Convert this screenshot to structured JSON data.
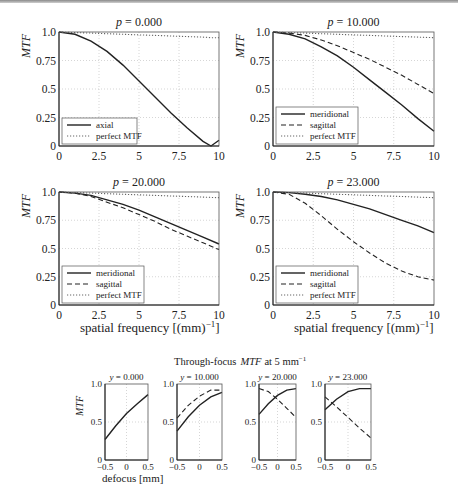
{
  "figure": {
    "top_row_titles": [
      "p = 0.000",
      "p = 10.000"
    ],
    "mid_row_titles": [
      "p = 20.000",
      "p = 23.000"
    ],
    "xlabel": "spatial frequency [(mm)",
    "xlabel_sup": "−1",
    "xlabel_close": "]",
    "ylabel": "MTF",
    "through_focus_title": "Through-focus",
    "through_focus_title_mtf": "MTF",
    "through_focus_title_rest": "at 5 mm",
    "through_focus_title_sup": "−1",
    "defocus_label": "defocus [mm]"
  },
  "chart_data": [
    {
      "type": "line",
      "title": "p = 0.000",
      "xlabel": "",
      "ylabel": "MTF",
      "xlim": [
        0,
        10
      ],
      "ylim": [
        0,
        1
      ],
      "xticks": [
        "0",
        "2.5",
        "5",
        "7.5",
        "10"
      ],
      "yticks": [
        "0",
        "0.25",
        "0.5",
        "0.75",
        "1.0"
      ],
      "grid": true,
      "legend": [
        "axial",
        "perfect MTF"
      ],
      "legend_position": "lower left",
      "x": [
        0,
        1,
        2,
        3,
        4,
        5,
        6,
        7,
        8,
        9,
        9.5,
        10
      ],
      "series": [
        {
          "name": "axial",
          "style": "solid",
          "values": [
            1.0,
            0.98,
            0.92,
            0.83,
            0.71,
            0.57,
            0.43,
            0.29,
            0.16,
            0.04,
            0.0,
            0.05
          ]
        },
        {
          "name": "perfect MTF",
          "style": "dotted",
          "values": [
            1.0,
            0.995,
            0.99,
            0.985,
            0.98,
            0.975,
            0.97,
            0.965,
            0.96,
            0.955,
            0.95,
            0.95
          ]
        }
      ]
    },
    {
      "type": "line",
      "title": "p = 10.000",
      "xlabel": "",
      "ylabel": "MTF",
      "xlim": [
        0,
        10
      ],
      "ylim": [
        0,
        1
      ],
      "xticks": [
        "0",
        "2.5",
        "5",
        "7.5",
        "10"
      ],
      "yticks": [
        "0",
        "0.25",
        "0.5",
        "0.75",
        "1.0"
      ],
      "grid": true,
      "legend": [
        "meridional",
        "sagittal",
        "perfect MTF"
      ],
      "legend_position": "lower left",
      "x": [
        0,
        1,
        2,
        3,
        4,
        5,
        6,
        7,
        8,
        9,
        10
      ],
      "series": [
        {
          "name": "meridional",
          "style": "solid",
          "values": [
            1.0,
            0.98,
            0.94,
            0.87,
            0.79,
            0.69,
            0.58,
            0.47,
            0.36,
            0.24,
            0.13
          ]
        },
        {
          "name": "sagittal",
          "style": "dashed",
          "values": [
            1.0,
            0.99,
            0.97,
            0.93,
            0.88,
            0.82,
            0.76,
            0.69,
            0.62,
            0.54,
            0.46
          ]
        },
        {
          "name": "perfect MTF",
          "style": "dotted",
          "values": [
            1.0,
            0.995,
            0.99,
            0.985,
            0.98,
            0.975,
            0.97,
            0.965,
            0.96,
            0.955,
            0.95
          ]
        }
      ]
    },
    {
      "type": "line",
      "title": "p = 20.000",
      "xlabel": "spatial frequency [(mm)^-1]",
      "ylabel": "MTF",
      "xlim": [
        0,
        10
      ],
      "ylim": [
        0,
        1
      ],
      "xticks": [
        "0",
        "2.5",
        "5",
        "7.5",
        "10"
      ],
      "yticks": [
        "0",
        "0.25",
        "0.5",
        "0.75",
        "1.0"
      ],
      "grid": true,
      "legend": [
        "meridional",
        "sagittal",
        "perfect MTF"
      ],
      "legend_position": "lower left",
      "x": [
        0,
        1,
        2,
        3,
        4,
        5,
        6,
        7,
        8,
        9,
        10
      ],
      "series": [
        {
          "name": "meridional",
          "style": "solid",
          "values": [
            1.0,
            0.99,
            0.97,
            0.93,
            0.89,
            0.84,
            0.78,
            0.72,
            0.66,
            0.6,
            0.54
          ]
        },
        {
          "name": "sagittal",
          "style": "dashed",
          "values": [
            1.0,
            0.99,
            0.96,
            0.91,
            0.86,
            0.8,
            0.74,
            0.67,
            0.61,
            0.55,
            0.49
          ]
        },
        {
          "name": "perfect MTF",
          "style": "dotted",
          "values": [
            1.0,
            0.995,
            0.99,
            0.985,
            0.98,
            0.975,
            0.97,
            0.965,
            0.96,
            0.955,
            0.95
          ]
        }
      ]
    },
    {
      "type": "line",
      "title": "p = 23.000",
      "xlabel": "spatial frequency [(mm)^-1]",
      "ylabel": "MTF",
      "xlim": [
        0,
        10
      ],
      "ylim": [
        0,
        1
      ],
      "xticks": [
        "0",
        "2.5",
        "5",
        "7.5",
        "10"
      ],
      "yticks": [
        "0",
        "0.25",
        "0.5",
        "0.75",
        "1.0"
      ],
      "grid": true,
      "legend": [
        "meridional",
        "sagittal",
        "perfect MTF"
      ],
      "legend_position": "lower left",
      "x": [
        0,
        1,
        2,
        3,
        4,
        5,
        6,
        7,
        8,
        9,
        10
      ],
      "series": [
        {
          "name": "meridional",
          "style": "solid",
          "values": [
            1.0,
            0.995,
            0.98,
            0.96,
            0.93,
            0.89,
            0.85,
            0.8,
            0.75,
            0.7,
            0.64
          ]
        },
        {
          "name": "sagittal",
          "style": "dashed",
          "values": [
            1.0,
            0.98,
            0.9,
            0.79,
            0.67,
            0.56,
            0.46,
            0.37,
            0.3,
            0.25,
            0.22
          ]
        },
        {
          "name": "perfect MTF",
          "style": "dotted",
          "values": [
            1.0,
            0.995,
            0.99,
            0.985,
            0.98,
            0.975,
            0.97,
            0.965,
            0.96,
            0.955,
            0.95
          ]
        }
      ]
    },
    {
      "type": "line",
      "title": "y = 0.000",
      "xlabel": "defocus [mm]",
      "ylabel": "MTF",
      "xlim": [
        -0.5,
        0.5
      ],
      "ylim": [
        0,
        1
      ],
      "xticks": [
        "−0.5",
        "0",
        "0.5"
      ],
      "yticks": [
        "0",
        "0.5",
        "1.0"
      ],
      "grid": true,
      "x": [
        -0.5,
        -0.25,
        0,
        0.25,
        0.5
      ],
      "series": [
        {
          "name": "meridional",
          "style": "solid",
          "values": [
            0.27,
            0.45,
            0.61,
            0.74,
            0.86
          ]
        }
      ]
    },
    {
      "type": "line",
      "title": "y = 10.000",
      "xlabel": "",
      "ylabel": "",
      "xlim": [
        -0.5,
        0.5
      ],
      "ylim": [
        0,
        1
      ],
      "xticks": [
        "−0.5",
        "0",
        "0.5"
      ],
      "yticks": [
        "0",
        "0.5",
        "1.0"
      ],
      "grid": true,
      "x": [
        -0.5,
        -0.25,
        0,
        0.25,
        0.5
      ],
      "series": [
        {
          "name": "meridional",
          "style": "solid",
          "values": [
            0.38,
            0.57,
            0.72,
            0.83,
            0.89
          ]
        },
        {
          "name": "sagittal",
          "style": "dashed",
          "values": [
            0.55,
            0.72,
            0.84,
            0.92,
            0.92
          ]
        }
      ]
    },
    {
      "type": "line",
      "title": "y = 20.000",
      "xlabel": "",
      "ylabel": "",
      "xlim": [
        -0.5,
        0.5
      ],
      "ylim": [
        0,
        1
      ],
      "xticks": [
        "−0.5",
        "0",
        "0.5"
      ],
      "yticks": [
        "0",
        "0.5",
        "1.0"
      ],
      "grid": true,
      "x": [
        -0.5,
        -0.25,
        0,
        0.25,
        0.5
      ],
      "series": [
        {
          "name": "meridional",
          "style": "solid",
          "values": [
            0.6,
            0.74,
            0.85,
            0.92,
            0.94
          ]
        },
        {
          "name": "sagittal",
          "style": "dashed",
          "values": [
            0.94,
            0.9,
            0.8,
            0.68,
            0.56
          ]
        }
      ]
    },
    {
      "type": "line",
      "title": "y = 23.000",
      "xlabel": "",
      "ylabel": "",
      "xlim": [
        -0.5,
        0.5
      ],
      "ylim": [
        0,
        1
      ],
      "xticks": [
        "−0.5",
        "0",
        "0.5"
      ],
      "yticks": [
        "0",
        "0.5",
        "1.0"
      ],
      "grid": true,
      "x": [
        -0.5,
        -0.25,
        0,
        0.25,
        0.5
      ],
      "series": [
        {
          "name": "meridional",
          "style": "solid",
          "values": [
            0.66,
            0.8,
            0.9,
            0.94,
            0.94
          ]
        },
        {
          "name": "sagittal",
          "style": "dashed",
          "values": [
            0.83,
            0.7,
            0.56,
            0.42,
            0.29
          ]
        }
      ]
    }
  ]
}
